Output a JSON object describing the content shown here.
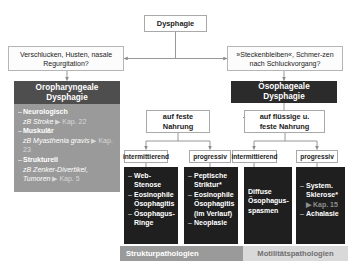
{
  "diagram": {
    "root": {
      "label": "Dysphagie"
    },
    "symptoms": {
      "left": "Verschlucken, Husten, nasale Regurgitation?",
      "right": "»Steckenbleiben«, Schmer-zen nach Schluckvorgang?"
    },
    "branches": {
      "left_banner": "Oropharyngeale\nDysphagie",
      "right_banner": "Ösophageale\nDysphagie"
    },
    "oropharyngeal_causes": [
      {
        "heading": "Neurologisch",
        "detail": "zB Stroke",
        "ref": "▶ Kap. 22"
      },
      {
        "heading": "Muskulär",
        "detail": "zB Myasthenia gravis",
        "ref": "▶ Kap. 23"
      },
      {
        "heading": "Strukturell",
        "detail": "zB Zenker-Divertikel, Tumoren",
        "ref": "▶ Kap. 5"
      }
    ],
    "food_split": {
      "solid": "auf feste\nNahrung",
      "liquid_solid": "auf flüssige u.\nfeste Nahrung"
    },
    "course_labels": {
      "solid_intermittent": "intermittierend",
      "solid_progressive": "progressiv",
      "liquid_intermittent": "intermittierend",
      "liquid_progressive": "progressiv"
    },
    "columns": [
      {
        "key": "structural-intermittent",
        "items": [
          {
            "text": "Web-Stenose"
          },
          {
            "text": "Eosinophile Ösophagitis"
          },
          {
            "text": "Ösophagus-Ringe"
          }
        ]
      },
      {
        "key": "structural-progressive",
        "items": [
          {
            "text": "Peptische Striktur*"
          },
          {
            "text": "Eosinophile Ösophagitis",
            "note": "(im Verlauf)"
          },
          {
            "text": "Neoplasie"
          }
        ]
      },
      {
        "key": "motility-intermittent",
        "items": [
          {
            "text": "Diffuse Ösophagus-spasmen"
          }
        ]
      },
      {
        "key": "motility-progressive",
        "items": [
          {
            "text": "System. Sklerose*",
            "ref": "▶ Kap. 15"
          },
          {
            "text": "Achalasie"
          }
        ]
      }
    ],
    "bands": {
      "structural": "Strukturpathologien",
      "motility": "Motilitätspathologien"
    },
    "colors": {
      "dark_banner": "#2b2b2b",
      "grey_banner": "#4e4e4e",
      "grey_panel": "#9a9a9a",
      "dark_panel": "#1f1f1f",
      "band_struct": "#9a9a9a",
      "band_motil": "#d9d9d9",
      "line": "#8c8c8c"
    }
  }
}
